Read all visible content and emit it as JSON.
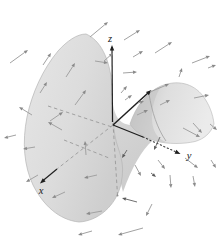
{
  "figure": {
    "axis_labels": {
      "x": "x",
      "y": "y",
      "z": "z"
    },
    "colors": {
      "background": "#ffffff",
      "axis": "#1f1f1f",
      "arrow_shaft": "#a2a2a2",
      "arrow_head": "#8a8a8a",
      "arrow_dark_shaft": "#6f6f6f",
      "arrow_dark_head": "#5a5a5a",
      "hidden_line": "#9a9a9a",
      "dotted_segment": "#3a3a3a",
      "surface_light": "#e9e9e9",
      "surface_mid": "#d9d9d9",
      "surface_dark": "#bfbfbf",
      "surface_edge": "#b5b5b5"
    },
    "surface": {
      "left_lobe": "M86 34 C100 40 110 58 112 86 C113 106 112 118 115 136 C118 152 126 161 121 184 C116 206 98 221 79 222 C59 220 43 205 33 185 C24 166 22 142 27 117 C32 93 43 69 58 51 C67 41 77 34 86 34 Z",
      "wedge": "M112 98 C114 116 119 124 131 125 C140 131 148 136 152 141 C142 150 132 167 123 192 C119 176 114 148 112 120 Z",
      "right_lobe": "M130 124 C136 106 147 92 161 86 C177 79.5 193 83 203 96 C209 104 213 114 214 124 C211 133 204 139 195 141.5 C184 144 168 144.5 156 141 C145 138 135 132 130 124 Z",
      "right_lobe_inner_shade": "M130 124 C136 106 147 92 161 86 C155 96 151 109 152 121 C153 132 158 139 166 142 C160 142 151 140 144 136 C137 132 132 128 130 124 Z",
      "right_lobe_fold": "M149 94 C152 112 157 128 166 141"
    },
    "axes": {
      "z_solid": [
        112.5,
        122,
        112,
        47
      ],
      "z_head": [
        112,
        45
      ],
      "z_hidden": [
        113,
        123,
        117.5,
        195
      ],
      "x_hidden": [
        113,
        125,
        57,
        169
      ],
      "x_solid": [
        57,
        169,
        42.5,
        181
      ],
      "x_head": [
        40,
        183.5
      ],
      "y_solid": [
        113,
        125,
        143,
        137
      ],
      "y_dotted": [
        143,
        137,
        175,
        151.5
      ],
      "y_head": [
        180.5,
        154
      ],
      "back_ray": [
        113,
        125,
        148,
        93
      ],
      "back_ray_head": [
        151.5,
        90
      ]
    },
    "hidden_lines": [
      [
        48,
        106,
        112,
        127
      ],
      [
        64,
        140,
        109,
        158
      ]
    ],
    "hidden_end_dot": [
      117.5,
      195.5
    ],
    "field_arrows": [
      [
        90,
        37,
        108,
        22
      ],
      [
        124,
        40,
        140,
        30
      ],
      [
        155,
        53,
        172,
        42
      ],
      [
        192,
        63,
        210,
        56
      ],
      [
        133,
        57,
        143,
        51
      ],
      [
        123,
        73,
        137,
        72
      ],
      [
        104,
        61,
        113,
        53
      ],
      [
        179,
        77,
        182,
        68
      ],
      [
        43,
        65,
        51,
        53
      ],
      [
        66,
        77,
        75,
        63
      ],
      [
        10,
        63,
        28,
        50
      ],
      [
        95,
        61,
        108,
        63
      ],
      [
        16,
        135,
        4,
        138
      ],
      [
        75,
        105,
        86,
        90
      ],
      [
        32,
        115,
        19,
        107
      ],
      [
        50,
        121,
        63,
        112
      ],
      [
        121,
        93,
        127,
        86
      ],
      [
        138,
        103,
        144,
        101
      ],
      [
        194,
        98,
        209,
        95
      ],
      [
        150,
        92,
        169,
        84
      ],
      [
        125,
        100,
        132,
        95
      ],
      [
        35,
        147,
        23,
        149
      ],
      [
        38,
        175,
        26,
        182
      ],
      [
        65,
        192,
        52,
        198
      ],
      [
        97,
        175,
        84,
        178
      ],
      [
        102,
        211,
        86,
        214
      ],
      [
        62,
        130,
        48,
        122
      ],
      [
        86,
        155,
        85,
        141
      ],
      [
        183,
        128,
        200,
        137
      ],
      [
        160,
        137,
        154,
        150,
        1
      ],
      [
        185,
        158,
        198,
        168
      ],
      [
        135,
        165,
        141,
        176
      ],
      [
        151,
        173,
        156,
        177,
        1
      ],
      [
        170,
        175,
        171,
        188
      ],
      [
        193,
        176,
        195,
        187
      ],
      [
        152,
        204,
        146,
        216
      ],
      [
        137,
        202,
        122,
        198,
        1
      ],
      [
        143,
        228,
        118,
        235
      ],
      [
        210,
        124,
        217,
        130
      ],
      [
        92,
        231,
        78,
        235
      ],
      [
        211,
        160,
        216,
        168
      ],
      [
        137,
        115,
        148,
        110
      ],
      [
        160,
        105,
        170,
        100
      ],
      [
        208,
        68,
        216,
        65
      ],
      [
        193,
        123,
        202,
        133
      ],
      [
        40,
        93,
        47,
        82
      ],
      [
        158,
        160,
        165,
        169
      ],
      [
        127,
        150,
        122,
        158,
        1
      ]
    ]
  }
}
